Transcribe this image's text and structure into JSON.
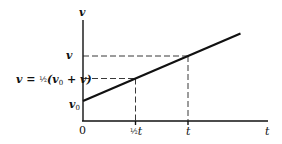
{
  "diagram": {
    "y_axis_label": "v",
    "x_axis_label": "t",
    "origin_label": "0",
    "y_labels": {
      "v": "v",
      "v_avg_lhs": "v = ",
      "v_avg_frac": "½",
      "v_avg_rhs": "(v",
      "v_avg_sub": "0",
      "v_avg_tail": " + v)",
      "v0": "v",
      "v0_sub": "0"
    },
    "x_labels": {
      "half_t_frac": "½",
      "half_t": "t",
      "t": "t"
    },
    "relationship": {
      "v0": 0.2,
      "v_at_t": 0.65,
      "t": 1,
      "half_t": 0.5,
      "v_avg": 0.425,
      "line_extends_to_t": 1.5
    }
  }
}
